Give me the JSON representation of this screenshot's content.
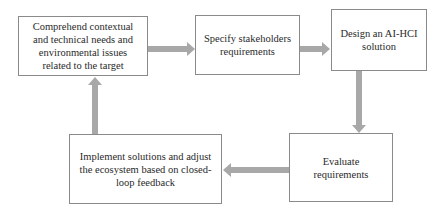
{
  "diagram": {
    "type": "cyclic-process-flow",
    "arrow_color": "#a8a8a8",
    "box_border_color": "#8a8a8a",
    "nodes": [
      {
        "id": "comprehend",
        "label": "Comprehend contextual and technical needs and environmental issues related to the target",
        "lines": [
          "Comprehend contextual",
          "and technical needs and",
          "environmental issues",
          "related to the target"
        ]
      },
      {
        "id": "specify",
        "label": "Specify stakeholders requirements",
        "lines": [
          "Specify stakeholders",
          "requirements"
        ]
      },
      {
        "id": "design",
        "label": "Design an AI-HCI solution",
        "lines": [
          "Design an AI-HCI",
          "solution"
        ]
      },
      {
        "id": "evaluate",
        "label": "Evaluate requirements",
        "lines": [
          "Evaluate",
          "requirements"
        ]
      },
      {
        "id": "implement",
        "label": "Implement solutions and adjust the ecosystem based on closed-loop feedback",
        "lines": [
          "Implement solutions and adjust",
          "the ecosystem based on closed-",
          "loop feedback"
        ]
      }
    ],
    "edges": [
      {
        "from": "comprehend",
        "to": "specify",
        "direction": "right"
      },
      {
        "from": "specify",
        "to": "design",
        "direction": "right"
      },
      {
        "from": "design",
        "to": "evaluate",
        "direction": "down"
      },
      {
        "from": "evaluate",
        "to": "implement",
        "direction": "left"
      },
      {
        "from": "implement",
        "to": "comprehend",
        "direction": "up"
      }
    ]
  }
}
